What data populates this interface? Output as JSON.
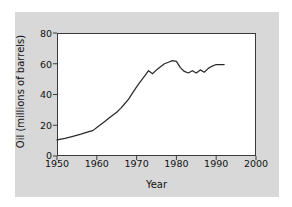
{
  "figure": {
    "background_color": "#ffffff",
    "panel_color": "#d8d8d8",
    "plot_background_color": "#ffffff",
    "axis_color": "#3a3a3a",
    "line_color": "#2a2a2a"
  },
  "chart_data": {
    "type": "line",
    "title": "",
    "xlabel": "Year",
    "ylabel": "Oil (millions of barrels)",
    "xlim": [
      1950,
      2000
    ],
    "ylim": [
      0,
      80
    ],
    "xticks": [
      1950,
      1960,
      1970,
      1980,
      1990,
      2000
    ],
    "yticks": [
      0,
      20,
      40,
      60,
      80
    ],
    "xtick_labels": [
      "1950",
      "1960",
      "1970",
      "1980",
      "1990",
      "2000"
    ],
    "ytick_labels": [
      "0",
      "20",
      "40",
      "60",
      "80"
    ],
    "grid": false,
    "legend": null,
    "series": [
      {
        "name": "Oil production",
        "x": [
          1950,
          1952,
          1954,
          1956,
          1958,
          1959,
          1960,
          1961,
          1962,
          1963,
          1964,
          1965,
          1966,
          1967,
          1968,
          1969,
          1970,
          1971,
          1972,
          1973,
          1974,
          1975,
          1976,
          1977,
          1978,
          1979,
          1980,
          1981,
          1982,
          1983,
          1984,
          1985,
          1986,
          1987,
          1988,
          1989,
          1990,
          1991,
          1992
        ],
        "y": [
          10.5,
          11.5,
          12.8,
          14.2,
          15.8,
          16.5,
          18.5,
          20.5,
          22.5,
          24.5,
          26.5,
          28.5,
          31.0,
          34.0,
          37.0,
          41.0,
          45.0,
          48.5,
          52.0,
          55.5,
          53.5,
          56.0,
          58.0,
          60.0,
          61.0,
          62.0,
          61.5,
          57.5,
          55.0,
          54.0,
          55.5,
          54.0,
          56.0,
          54.5,
          57.0,
          58.5,
          59.5,
          59.5,
          59.5
        ]
      }
    ]
  },
  "axes": {
    "ytick_positions_px": [
      156,
      125.5,
      95,
      64.5,
      34
    ],
    "xtick_positions_px": [
      57,
      96.8,
      136.6,
      176.4,
      216.2,
      256
    ]
  }
}
